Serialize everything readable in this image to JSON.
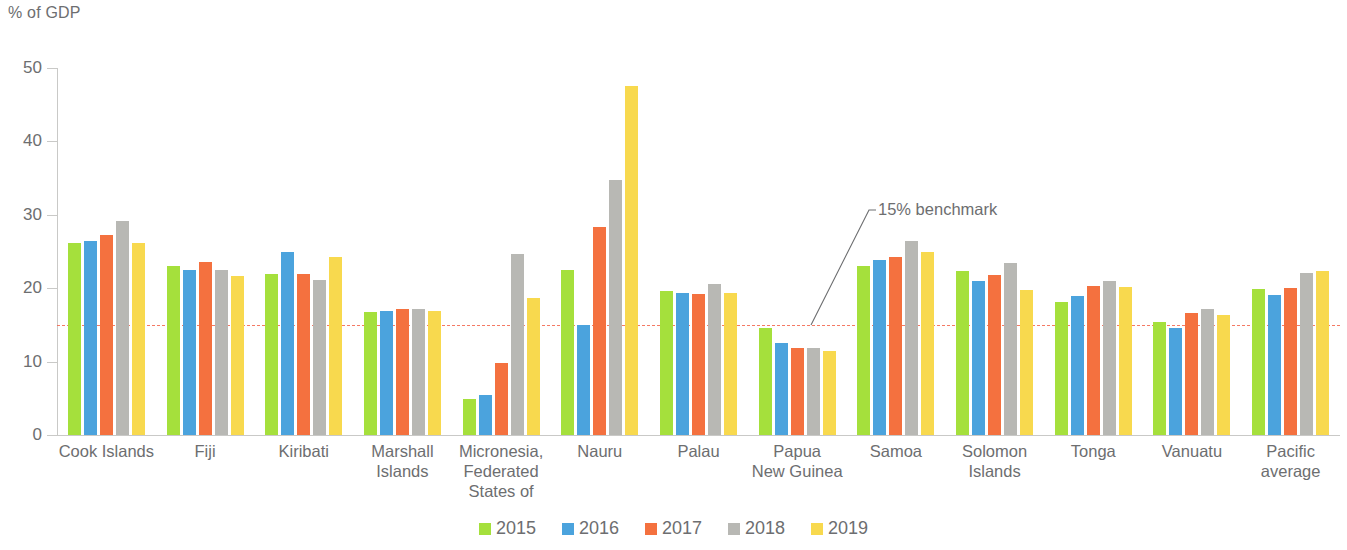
{
  "unit_label": "% of GDP",
  "benchmark": {
    "value": 15,
    "label": "15% benchmark",
    "color": "#f4634a"
  },
  "axis": {
    "y_ticks": [
      0,
      10,
      20,
      30,
      40,
      50
    ],
    "y_min": 0,
    "y_max": 50
  },
  "legend": [
    {
      "label": "2015",
      "color": "#a5e03c"
    },
    {
      "label": "2016",
      "color": "#4ba3dd"
    },
    {
      "label": "2017",
      "color": "#f4713f"
    },
    {
      "label": "2018",
      "color": "#b8b8b4"
    },
    {
      "label": "2019",
      "color": "#f8d94e"
    }
  ],
  "chart_data": {
    "type": "bar",
    "title": "",
    "subtitle": "",
    "xlabel": "",
    "ylabel": "% of GDP",
    "ylim": [
      0,
      50
    ],
    "yticks": [
      0,
      10,
      20,
      30,
      40,
      50
    ],
    "grid": false,
    "legend_position": "bottom",
    "annotations": [
      {
        "text": "15% benchmark",
        "type": "reference-line-callout",
        "value": 15
      }
    ],
    "categories": [
      "Cook Islands",
      "Fiji",
      "Kiribati",
      "Marshall Islands",
      "Micronesia, Federated States of",
      "Nauru",
      "Palau",
      "Papua New Guinea",
      "Samoa",
      "Solomon Islands",
      "Tonga",
      "Vanuatu",
      "Pacific average"
    ],
    "category_lines": [
      [
        "Cook Islands"
      ],
      [
        "Fiji"
      ],
      [
        "Kiribati"
      ],
      [
        "Marshall",
        "Islands"
      ],
      [
        "Micronesia,",
        "Federated",
        "States of"
      ],
      [
        "Nauru"
      ],
      [
        "Palau"
      ],
      [
        "Papua",
        "New Guinea"
      ],
      [
        "Samoa"
      ],
      [
        "Solomon",
        "Islands"
      ],
      [
        "Tonga"
      ],
      [
        "Vanuatu"
      ],
      [
        "Pacific",
        "average"
      ]
    ],
    "series": [
      {
        "name": "2015",
        "color": "#a5e03c",
        "values": [
          26.1,
          23.0,
          22.0,
          16.8,
          4.9,
          22.5,
          19.6,
          14.6,
          23.0,
          22.4,
          18.1,
          15.4,
          19.9
        ]
      },
      {
        "name": "2016",
        "color": "#4ba3dd",
        "values": [
          26.4,
          22.5,
          24.9,
          16.9,
          5.5,
          15.0,
          19.4,
          12.6,
          23.9,
          21.0,
          19.0,
          14.6,
          19.1
        ]
      },
      {
        "name": "2017",
        "color": "#f4713f",
        "values": [
          27.3,
          23.6,
          22.0,
          17.2,
          9.8,
          28.4,
          19.2,
          11.9,
          24.2,
          21.8,
          20.3,
          16.6,
          20.0
        ]
      },
      {
        "name": "2018",
        "color": "#b8b8b4",
        "values": [
          29.1,
          22.5,
          21.1,
          17.2,
          24.6,
          34.7,
          20.6,
          11.8,
          26.4,
          23.4,
          21.0,
          17.2,
          22.1
        ]
      },
      {
        "name": "2019",
        "color": "#f8d94e",
        "values": [
          26.2,
          21.6,
          24.2,
          16.9,
          18.7,
          47.6,
          19.3,
          11.5,
          25.0,
          19.8,
          20.2,
          16.3,
          22.3
        ]
      }
    ]
  }
}
